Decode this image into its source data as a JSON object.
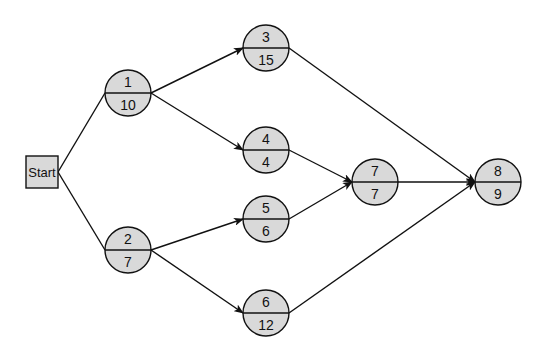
{
  "diagram": {
    "type": "network-activity-on-node",
    "start": {
      "label": "Start",
      "x": 26,
      "y": 156,
      "w": 32,
      "h": 32
    },
    "node_radius": 23,
    "nodes": [
      {
        "id": "1",
        "top": "1",
        "bottom": "10",
        "cx": 128,
        "cy": 93
      },
      {
        "id": "2",
        "top": "2",
        "bottom": "7",
        "cx": 128,
        "cy": 250
      },
      {
        "id": "3",
        "top": "3",
        "bottom": "15",
        "cx": 266,
        "cy": 48
      },
      {
        "id": "4",
        "top": "4",
        "bottom": "4",
        "cx": 266,
        "cy": 150
      },
      {
        "id": "5",
        "top": "5",
        "bottom": "6",
        "cx": 266,
        "cy": 219
      },
      {
        "id": "6",
        "top": "6",
        "bottom": "12",
        "cx": 266,
        "cy": 313
      },
      {
        "id": "7",
        "top": "7",
        "bottom": "7",
        "cx": 375,
        "cy": 182
      },
      {
        "id": "8",
        "top": "8",
        "bottom": "9",
        "cx": 498,
        "cy": 182
      }
    ],
    "edges": [
      {
        "from": "start",
        "to": "1",
        "arrow": false
      },
      {
        "from": "start",
        "to": "2",
        "arrow": false
      },
      {
        "from": "1",
        "to": "3",
        "arrow": true
      },
      {
        "from": "1",
        "to": "4",
        "arrow": true
      },
      {
        "from": "2",
        "to": "5",
        "arrow": true
      },
      {
        "from": "2",
        "to": "6",
        "arrow": true
      },
      {
        "from": "3",
        "to": "8",
        "arrow": true
      },
      {
        "from": "4",
        "to": "7",
        "arrow": true
      },
      {
        "from": "5",
        "to": "7",
        "arrow": true
      },
      {
        "from": "7",
        "to": "8",
        "arrow": true
      },
      {
        "from": "6",
        "to": "8",
        "arrow": true
      }
    ],
    "colors": {
      "node_fill": "#d9d9d9",
      "stroke": "#111111",
      "background": "#ffffff"
    }
  }
}
